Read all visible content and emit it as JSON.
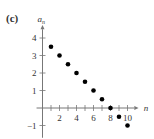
{
  "panel_label": "(c)",
  "chart_data": {
    "type": "scatter",
    "title": "",
    "xlabel": "n",
    "ylabel": "a_n",
    "x": [
      1,
      2,
      3,
      4,
      5,
      6,
      7,
      8,
      9,
      10
    ],
    "series": [
      {
        "name": "a_n",
        "values": [
          3.5,
          3,
          2.5,
          2,
          1.5,
          1,
          0.5,
          0,
          -0.5,
          -1
        ]
      }
    ],
    "xticks": [
      2,
      4,
      6,
      8,
      10
    ],
    "yticks": [
      -1,
      1,
      2,
      3,
      4
    ],
    "xlim": [
      0,
      11
    ],
    "ylim": [
      -1.5,
      4.7
    ],
    "grid": false,
    "legend": "none",
    "point_color": "#000000"
  }
}
